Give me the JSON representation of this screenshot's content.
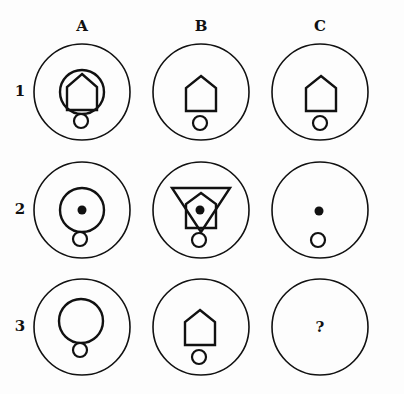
{
  "puzzle": {
    "columns": [
      {
        "label": "A",
        "x": 82
      },
      {
        "label": "B",
        "x": 201
      },
      {
        "label": "C",
        "x": 320
      }
    ],
    "rows": [
      {
        "label": "1",
        "y": 92
      },
      {
        "label": "2",
        "y": 210
      },
      {
        "label": "3",
        "y": 327
      }
    ],
    "cells": {
      "1A": [
        "large-circle",
        "pentagon",
        "small-circle"
      ],
      "1B": [
        "pentagon",
        "small-circle"
      ],
      "1C": [
        "pentagon",
        "small-circle"
      ],
      "2A": [
        "large-circle",
        "dot",
        "small-circle"
      ],
      "2B": [
        "inverted-triangle",
        "pentagon",
        "dot",
        "small-circle"
      ],
      "2C": [
        "dot",
        "small-circle"
      ],
      "3A": [
        "large-circle",
        "small-circle"
      ],
      "3B": [
        "pentagon",
        "small-circle"
      ],
      "3C": [
        "question-mark"
      ]
    },
    "question_mark": "?"
  }
}
